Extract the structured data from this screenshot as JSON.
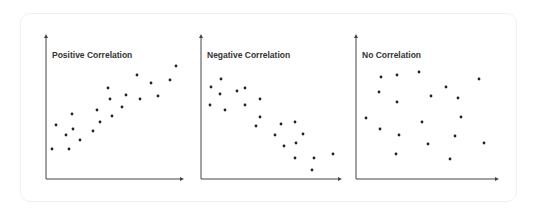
{
  "chart_data": [
    {
      "type": "scatter",
      "title": "Positive Correlation",
      "xlabel": "",
      "ylabel": "",
      "grid": false,
      "axes": {
        "origin": [
          46,
          179
        ],
        "x_end": 184,
        "y_top": 34
      },
      "points": [
        [
          52,
          149
        ],
        [
          56,
          125
        ],
        [
          66,
          135
        ],
        [
          69,
          149
        ],
        [
          72,
          114
        ],
        [
          73,
          129
        ],
        [
          80,
          140
        ],
        [
          93,
          131
        ],
        [
          97,
          110
        ],
        [
          100,
          122
        ],
        [
          108,
          88
        ],
        [
          110,
          99
        ],
        [
          112,
          116
        ],
        [
          122,
          107
        ],
        [
          126,
          95
        ],
        [
          137,
          75
        ],
        [
          140,
          99
        ],
        [
          151,
          83
        ],
        [
          158,
          96
        ],
        [
          170,
          80
        ],
        [
          176,
          66
        ]
      ]
    },
    {
      "type": "scatter",
      "title": "Negative Correlation",
      "xlabel": "",
      "ylabel": "",
      "grid": false,
      "axes": {
        "origin": [
          201,
          179
        ],
        "x_end": 342,
        "y_top": 34
      },
      "points": [
        [
          211,
          87
        ],
        [
          221,
          79
        ],
        [
          220,
          94
        ],
        [
          210,
          105
        ],
        [
          225,
          110
        ],
        [
          237,
          91
        ],
        [
          245,
          88
        ],
        [
          245,
          105
        ],
        [
          260,
          99
        ],
        [
          260,
          117
        ],
        [
          256,
          126
        ],
        [
          281,
          124
        ],
        [
          295,
          122
        ],
        [
          275,
          135
        ],
        [
          303,
          134
        ],
        [
          284,
          146
        ],
        [
          296,
          143
        ],
        [
          295,
          158
        ],
        [
          314,
          158
        ],
        [
          333,
          154
        ],
        [
          312,
          170
        ]
      ]
    },
    {
      "type": "scatter",
      "title": "No Correlation",
      "xlabel": "",
      "ylabel": "",
      "grid": false,
      "axes": {
        "origin": [
          356,
          179
        ],
        "x_end": 499,
        "y_top": 34
      },
      "points": [
        [
          381,
          77
        ],
        [
          397,
          75
        ],
        [
          419,
          72
        ],
        [
          479,
          79
        ],
        [
          379,
          92
        ],
        [
          446,
          87
        ],
        [
          431,
          96
        ],
        [
          458,
          98
        ],
        [
          397,
          102
        ],
        [
          366,
          118
        ],
        [
          461,
          117
        ],
        [
          422,
          122
        ],
        [
          380,
          129
        ],
        [
          399,
          135
        ],
        [
          455,
          136
        ],
        [
          428,
          144
        ],
        [
          484,
          143
        ],
        [
          396,
          154
        ],
        [
          450,
          159
        ]
      ]
    }
  ],
  "colors": {
    "axis": "#444444",
    "dot": "#222222",
    "title": "#333333",
    "card_border": "#f0f0f0"
  }
}
